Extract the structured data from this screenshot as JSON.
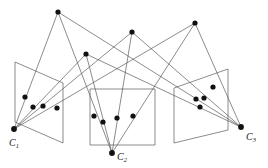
{
  "figure": {
    "type": "multi-view-geometry-diagram",
    "title": "",
    "width": 268,
    "height": 168,
    "background_color": "#ffffff",
    "line_color": "#5a5a5a",
    "point_color": "#111111",
    "label_color": "#1a1a1a"
  },
  "cameras": [
    {
      "id": "c1",
      "label": "C",
      "subscript": "1",
      "center": {
        "x": 14,
        "y": 129
      },
      "label_pos": {
        "x": 9,
        "y": 138
      }
    },
    {
      "id": "c2",
      "label": "C",
      "subscript": "2",
      "center": {
        "x": 112,
        "y": 153
      },
      "label_pos": {
        "x": 117,
        "y": 152
      }
    },
    {
      "id": "c3",
      "label": "C",
      "subscript": "3",
      "center": {
        "x": 241,
        "y": 127
      },
      "label_pos": {
        "x": 246,
        "y": 132
      }
    }
  ],
  "image_planes": [
    {
      "id": "plane-1",
      "camera": "c1",
      "shape": "parallelogram",
      "corners": [
        {
          "x": 15,
          "y": 62
        },
        {
          "x": 63,
          "y": 83
        },
        {
          "x": 63,
          "y": 143
        },
        {
          "x": 15,
          "y": 122
        }
      ]
    },
    {
      "id": "plane-2",
      "camera": "c2",
      "shape": "rectangle",
      "corners": [
        {
          "x": 90,
          "y": 89
        },
        {
          "x": 155,
          "y": 89
        },
        {
          "x": 155,
          "y": 145
        },
        {
          "x": 90,
          "y": 145
        }
      ]
    },
    {
      "id": "plane-3",
      "camera": "c3",
      "shape": "parallelogram",
      "corners": [
        {
          "x": 174,
          "y": 88
        },
        {
          "x": 228,
          "y": 69
        },
        {
          "x": 228,
          "y": 130
        },
        {
          "x": 174,
          "y": 143
        }
      ]
    }
  ],
  "scene_points": [
    {
      "id": "X1",
      "x": 58,
      "y": 12
    },
    {
      "id": "X2",
      "x": 86,
      "y": 54
    },
    {
      "id": "X3",
      "x": 132,
      "y": 32
    },
    {
      "id": "X4",
      "x": 195,
      "y": 23
    }
  ],
  "image_points": [
    {
      "id": "x1-1",
      "plane": "plane-1",
      "scene_point": "X1",
      "x": 25,
      "y": 97
    },
    {
      "id": "x1-2",
      "plane": "plane-1",
      "scene_point": "X2",
      "x": 33,
      "y": 107
    },
    {
      "id": "x1-3",
      "plane": "plane-1",
      "scene_point": "X3",
      "x": 43,
      "y": 106
    },
    {
      "id": "x1-4",
      "plane": "plane-1",
      "scene_point": "X4",
      "x": 57,
      "y": 108
    },
    {
      "id": "x2-1",
      "plane": "plane-2",
      "scene_point": "X1",
      "x": 94,
      "y": 116
    },
    {
      "id": "x2-2",
      "plane": "plane-2",
      "scene_point": "X2",
      "x": 103,
      "y": 122
    },
    {
      "id": "x2-3",
      "plane": "plane-2",
      "scene_point": "X3",
      "x": 117,
      "y": 118
    },
    {
      "id": "x2-4",
      "plane": "plane-2",
      "scene_point": "X4",
      "x": 133,
      "y": 116
    },
    {
      "id": "x3-1",
      "plane": "plane-3",
      "scene_point": "X4",
      "x": 213,
      "y": 87
    },
    {
      "id": "x3-2",
      "plane": "plane-3",
      "scene_point": "X2",
      "x": 196,
      "y": 99
    },
    {
      "id": "x3-3",
      "plane": "plane-3",
      "scene_point": "X3",
      "x": 204,
      "y": 98
    },
    {
      "id": "x3-4",
      "plane": "plane-3",
      "scene_point": "X1",
      "x": 200,
      "y": 107
    }
  ],
  "projection_rays": [
    {
      "from_camera": "c1",
      "to_scene_point": "X1"
    },
    {
      "from_camera": "c1",
      "to_scene_point": "X2"
    },
    {
      "from_camera": "c1",
      "to_scene_point": "X3"
    },
    {
      "from_camera": "c1",
      "to_scene_point": "X4"
    },
    {
      "from_camera": "c2",
      "to_scene_point": "X1"
    },
    {
      "from_camera": "c2",
      "to_scene_point": "X2"
    },
    {
      "from_camera": "c2",
      "to_scene_point": "X3"
    },
    {
      "from_camera": "c2",
      "to_scene_point": "X4"
    },
    {
      "from_camera": "c3",
      "to_scene_point": "X1"
    },
    {
      "from_camera": "c3",
      "to_scene_point": "X2"
    },
    {
      "from_camera": "c3",
      "to_scene_point": "X3"
    },
    {
      "from_camera": "c3",
      "to_scene_point": "X4"
    }
  ],
  "style": {
    "ray_stroke_width": 0.7,
    "plane_stroke_width": 0.7,
    "point_radius": 2.6
  }
}
